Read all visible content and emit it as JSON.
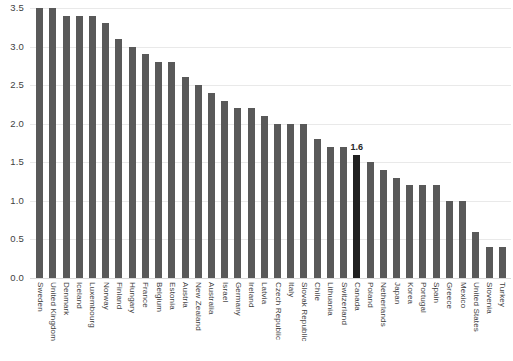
{
  "chart_data": {
    "type": "bar",
    "title": "",
    "subtitle": "",
    "xlabel": "",
    "ylabel": "",
    "ylim": [
      0.0,
      3.5
    ],
    "y_ticks": [
      "0.0",
      "0.5",
      "1.0",
      "1.5",
      "2.0",
      "2.5",
      "3.0",
      "3.5"
    ],
    "y_tick_values": [
      0.0,
      0.5,
      1.0,
      1.5,
      2.0,
      2.5,
      3.0,
      3.5
    ],
    "grid": true,
    "legend": "none",
    "categories": [
      "Sweden",
      "United Kingdom",
      "Denmark",
      "Iceland",
      "Luxembourg",
      "Norway",
      "Finland",
      "Hungary",
      "France",
      "Belgium",
      "Estonia",
      "Austria",
      "New Zealand",
      "Australia",
      "Israel",
      "Germany",
      "Ireland",
      "Latvia",
      "Czech Republic",
      "Italy",
      "Slovak Republic",
      "Chile",
      "Lithuania",
      "Switzerland",
      "Canada",
      "Poland",
      "Netherlands",
      "Japan",
      "Korea",
      "Portugal",
      "Spain",
      "Greece",
      "Mexico",
      "United States",
      "Slovenia",
      "Turkey"
    ],
    "values": [
      3.5,
      3.5,
      3.4,
      3.4,
      3.4,
      3.3,
      3.1,
      3.0,
      2.9,
      2.8,
      2.8,
      2.6,
      2.5,
      2.4,
      2.3,
      2.2,
      2.2,
      2.1,
      2.0,
      2.0,
      2.0,
      1.8,
      1.7,
      1.7,
      1.6,
      1.5,
      1.4,
      1.3,
      1.2,
      1.2,
      1.2,
      1.0,
      1.0,
      0.6,
      0.4,
      0.4
    ],
    "data_labels": {
      "Canada": "1.6"
    },
    "highlight_category": "Canada",
    "colors": {
      "bar": "#595959",
      "highlight_bar": "#202020",
      "gridline": "#e9e9e9",
      "background": "#ffffff",
      "text": "#3f3f3f"
    }
  }
}
